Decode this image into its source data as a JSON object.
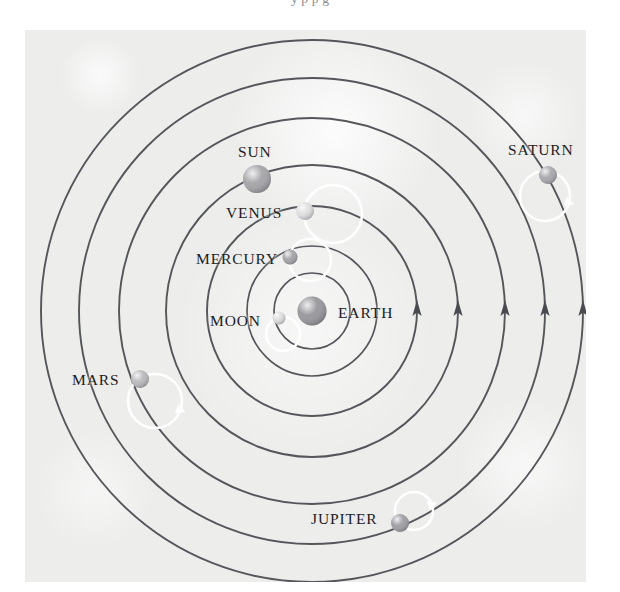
{
  "page": {
    "cut_text_above": "y p p g",
    "figure_title": "",
    "background_color": "#ffffff",
    "panel_color": "#ededec"
  },
  "diagram": {
    "type": "geocentric-solar-system",
    "orbit_color": "#55565a",
    "epicycle_color": "#ffffff",
    "center": {
      "x": 312,
      "y": 311
    },
    "center_body": {
      "name": "EARTH",
      "label": "EARTH",
      "cx": 312,
      "cy": 311,
      "r": 14.5,
      "color": "#8d8d92",
      "label_x": 338,
      "label_y": 304
    },
    "orbits": [
      {
        "name": "moon-orbit",
        "r": 38
      },
      {
        "name": "mercury-orbit",
        "r": 65
      },
      {
        "name": "venus-orbit",
        "r": 105
      },
      {
        "name": "sun-orbit",
        "r": 146
      },
      {
        "name": "mars-orbit",
        "r": 193
      },
      {
        "name": "jupiter-orbit",
        "r": 233
      },
      {
        "name": "saturn-orbit",
        "r": 271
      }
    ],
    "bodies": [
      {
        "name": "MOON",
        "label": "MOON",
        "cx": 279,
        "cy": 318,
        "r": 6.5,
        "color": "#d9d9da",
        "label_x": 210,
        "label_y": 312,
        "epicycle": {
          "cx": 283,
          "cy": 334,
          "r": 17,
          "arrow": false
        }
      },
      {
        "name": "MERCURY",
        "label": "MERCURY",
        "cx": 290,
        "cy": 257,
        "r": 7.5,
        "color": "#9b9b9f",
        "label_x": 196,
        "label_y": 250,
        "epicycle": {
          "cx": 310,
          "cy": 260,
          "r": 21,
          "arrow": false
        }
      },
      {
        "name": "VENUS",
        "label": "VENUS",
        "cx": 305,
        "cy": 211,
        "r": 9,
        "color": "#dcdcdd",
        "label_x": 226,
        "label_y": 204,
        "epicycle": {
          "cx": 333,
          "cy": 214,
          "r": 29,
          "arrow": false
        }
      },
      {
        "name": "SUN",
        "label": "SUN",
        "cx": 257,
        "cy": 179,
        "r": 14,
        "color": "#9d9da1",
        "label_x": 238,
        "label_y": 143,
        "epicycle": null
      },
      {
        "name": "MARS",
        "label": "MARS",
        "cx": 140,
        "cy": 379,
        "r": 9,
        "color": "#b3b3b6",
        "label_x": 72,
        "label_y": 371,
        "epicycle": {
          "cx": 155,
          "cy": 401,
          "r": 27,
          "arrow": true,
          "arrow_angle": 20
        }
      },
      {
        "name": "JUPITER",
        "label": "JUPITER",
        "cx": 400,
        "cy": 523,
        "r": 9,
        "color": "#94949a",
        "label_x": 311,
        "label_y": 510,
        "epicycle": {
          "cx": 414,
          "cy": 511,
          "r": 19,
          "arrow": true,
          "arrow_angle": 340
        }
      },
      {
        "name": "SATURN",
        "label": "SATURN",
        "cx": 548,
        "cy": 175,
        "r": 9,
        "color": "#a0a0a5",
        "label_x": 508,
        "label_y": 141,
        "epicycle": {
          "cx": 545,
          "cy": 196,
          "r": 25,
          "arrow": true,
          "arrow_angle": 15
        }
      }
    ],
    "direction_arrows": [
      {
        "name": "direction-arrow-venus-orbit",
        "x": 417,
        "y": 311
      },
      {
        "name": "direction-arrow-sun-orbit",
        "x": 458,
        "y": 311
      },
      {
        "name": "direction-arrow-mars-orbit",
        "x": 505,
        "y": 311
      },
      {
        "name": "direction-arrow-jupiter-orbit",
        "x": 545,
        "y": 311
      },
      {
        "name": "direction-arrow-saturn-orbit",
        "x": 583,
        "y": 311
      }
    ]
  }
}
